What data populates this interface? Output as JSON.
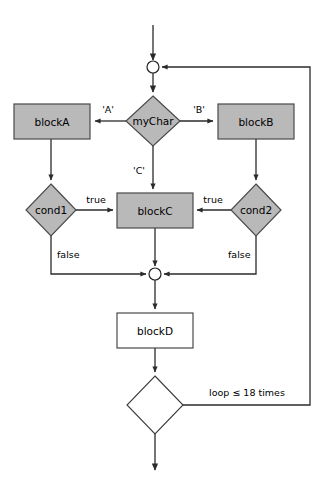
{
  "diagram": {
    "type": "flowchart",
    "colors": {
      "process_fill": "#b9b9b9",
      "process_stroke": "#4a4a4a",
      "open_fill": "#ffffff",
      "open_stroke": "#3a3a3a",
      "edge": "#2b2b2b",
      "text": "#000000",
      "background": "#ffffff"
    },
    "nodes": [
      {
        "id": "entry",
        "kind": "entry-arrow",
        "label": "",
        "shape": "arrow",
        "cx": 153,
        "cy": 25
      },
      {
        "id": "merge-top",
        "kind": "connector",
        "label": "",
        "shape": "circle",
        "cx": 153,
        "cy": 67,
        "r": 6
      },
      {
        "id": "mychar",
        "kind": "decision",
        "label": "myChar",
        "shape": "diamond",
        "cx": 153,
        "cy": 121,
        "rx": 27,
        "ry": 25
      },
      {
        "id": "blocka",
        "kind": "process",
        "label": "blockA",
        "shape": "rect",
        "x": 14,
        "y": 104,
        "w": 76,
        "h": 35
      },
      {
        "id": "blockb",
        "kind": "process",
        "label": "blockB",
        "shape": "rect",
        "x": 218,
        "y": 104,
        "w": 76,
        "h": 35
      },
      {
        "id": "cond1",
        "kind": "decision",
        "label": "cond1",
        "shape": "diamond",
        "cx": 51,
        "cy": 210,
        "rx": 25,
        "ry": 26
      },
      {
        "id": "blockc",
        "kind": "process",
        "label": "blockC",
        "shape": "rect",
        "x": 117,
        "y": 193,
        "w": 76,
        "h": 35
      },
      {
        "id": "cond2",
        "kind": "decision",
        "label": "cond2",
        "shape": "diamond",
        "cx": 256,
        "cy": 210,
        "rx": 25,
        "ry": 26
      },
      {
        "id": "merge-bottom",
        "kind": "connector",
        "label": "",
        "shape": "circle",
        "cx": 155,
        "cy": 274,
        "r": 6
      },
      {
        "id": "blockd",
        "kind": "process-open",
        "label": "blockD",
        "shape": "rect",
        "x": 117,
        "y": 313,
        "w": 76,
        "h": 35
      },
      {
        "id": "loop-test",
        "kind": "decision-open",
        "label": "",
        "shape": "diamond",
        "cx": 155,
        "cy": 405,
        "rx": 28,
        "ry": 29
      },
      {
        "id": "exit",
        "kind": "exit-arrow",
        "label": "",
        "shape": "arrow",
        "cx": 155,
        "cy": 470
      }
    ],
    "edge_labels": [
      {
        "id": "label-a",
        "text": "'A'",
        "x": 108,
        "y": 110
      },
      {
        "id": "label-b",
        "text": "'B'",
        "x": 199,
        "y": 110
      },
      {
        "id": "label-c",
        "text": "'C'",
        "x": 139,
        "y": 171
      },
      {
        "id": "label-true-left",
        "text": "true",
        "x": 96,
        "y": 200
      },
      {
        "id": "label-true-right",
        "text": "true",
        "x": 213,
        "y": 200
      },
      {
        "id": "label-false-left",
        "text": "false",
        "x": 64,
        "y": 255
      },
      {
        "id": "label-false-right",
        "text": "false",
        "x": 235,
        "y": 255
      },
      {
        "id": "label-loop",
        "text": "loop ≤ 18 times",
        "x": 247,
        "y": 393
      }
    ],
    "edges": [
      {
        "id": "e-entry",
        "from": "entry",
        "to": "merge-top",
        "label": ""
      },
      {
        "id": "e-merge-mychar",
        "from": "merge-top",
        "to": "mychar",
        "label": ""
      },
      {
        "id": "e-mychar-blocka",
        "from": "mychar",
        "to": "blocka",
        "label": "'A'"
      },
      {
        "id": "e-mychar-blockb",
        "from": "mychar",
        "to": "blockb",
        "label": "'B'"
      },
      {
        "id": "e-mychar-blockc",
        "from": "mychar",
        "to": "blockc",
        "label": "'C'"
      },
      {
        "id": "e-blocka-cond1",
        "from": "blocka",
        "to": "cond1",
        "label": ""
      },
      {
        "id": "e-blockb-cond2",
        "from": "blockb",
        "to": "cond2",
        "label": ""
      },
      {
        "id": "e-cond1-blockc",
        "from": "cond1",
        "to": "blockc",
        "label": "true"
      },
      {
        "id": "e-cond2-blockc",
        "from": "cond2",
        "to": "blockc",
        "label": "true"
      },
      {
        "id": "e-cond1-merge",
        "from": "cond1",
        "to": "merge-bottom",
        "label": "false"
      },
      {
        "id": "e-cond2-merge",
        "from": "cond2",
        "to": "merge-bottom",
        "label": "false"
      },
      {
        "id": "e-blockc-merge",
        "from": "blockc",
        "to": "merge-bottom",
        "label": ""
      },
      {
        "id": "e-merge-blockd",
        "from": "merge-bottom",
        "to": "blockd",
        "label": ""
      },
      {
        "id": "e-blockd-looptest",
        "from": "blockd",
        "to": "loop-test",
        "label": ""
      },
      {
        "id": "e-looptest-merge",
        "from": "loop-test",
        "to": "merge-top",
        "label": "loop ≤ 18 times"
      },
      {
        "id": "e-looptest-exit",
        "from": "loop-test",
        "to": "exit",
        "label": ""
      }
    ]
  }
}
